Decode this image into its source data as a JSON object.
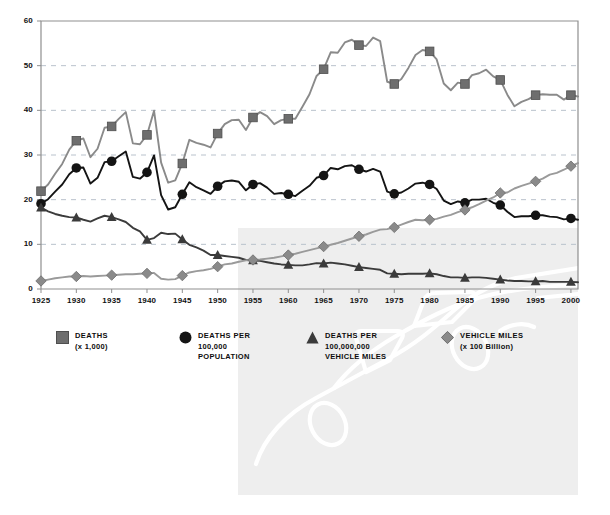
{
  "chart_data": {
    "type": "line",
    "title": "",
    "xlabel": "",
    "ylabel": "",
    "xlim": [
      1925,
      2001
    ],
    "ylim": [
      0,
      60
    ],
    "yticks": [
      0,
      10,
      20,
      30,
      40,
      50,
      60
    ],
    "xticks": [
      1925,
      1930,
      1935,
      1940,
      1945,
      1950,
      1955,
      1960,
      1965,
      1970,
      1975,
      1980,
      1985,
      1990,
      1995,
      2000
    ],
    "grid": "horizontal-dashed",
    "legend_position": "below-plot",
    "marker_years": [
      1925,
      1930,
      1935,
      1940,
      1945,
      1950,
      1955,
      1960,
      1965,
      1970,
      1975,
      1980,
      1985,
      1990,
      1995,
      2000
    ],
    "x": [
      1925,
      1926,
      1927,
      1928,
      1929,
      1930,
      1931,
      1932,
      1933,
      1934,
      1935,
      1936,
      1937,
      1938,
      1939,
      1940,
      1941,
      1942,
      1943,
      1944,
      1945,
      1946,
      1947,
      1948,
      1949,
      1950,
      1951,
      1952,
      1953,
      1954,
      1955,
      1956,
      1957,
      1958,
      1959,
      1960,
      1961,
      1962,
      1963,
      1964,
      1965,
      1966,
      1967,
      1968,
      1969,
      1970,
      1971,
      1972,
      1973,
      1974,
      1975,
      1976,
      1977,
      1978,
      1979,
      1980,
      1981,
      1982,
      1983,
      1984,
      1985,
      1986,
      1987,
      1988,
      1989,
      1990,
      1991,
      1992,
      1993,
      1994,
      1995,
      1996,
      1997,
      1998,
      1999,
      2000,
      2001
    ],
    "series": [
      {
        "name": "DEATHS (x 1,000)",
        "key": "deaths",
        "marker": "square",
        "color": "#6e6e6e",
        "line_color": "#8a8a8a",
        "values": [
          21.9,
          23.4,
          25.8,
          28.0,
          31.2,
          33.2,
          33.7,
          29.5,
          31.4,
          36.1,
          36.4,
          38.1,
          39.6,
          32.6,
          32.4,
          34.5,
          39.9,
          28.3,
          23.8,
          24.3,
          28.1,
          33.4,
          32.7,
          32.3,
          31.7,
          34.8,
          36.9,
          37.8,
          37.9,
          35.6,
          38.4,
          39.6,
          38.7,
          36.9,
          37.8,
          38.1,
          38.1,
          40.8,
          43.6,
          47.7,
          49.2,
          53.0,
          52.9,
          55.2,
          55.8,
          54.6,
          54.4,
          56.3,
          55.5,
          46.4,
          45.9,
          47.0,
          49.5,
          52.4,
          53.5,
          53.2,
          51.4,
          46.0,
          44.5,
          46.2,
          45.9,
          47.9,
          48.3,
          49.1,
          47.6,
          46.8,
          43.5,
          40.9,
          41.9,
          42.5,
          43.4,
          43.6,
          43.5,
          43.5,
          42.4,
          43.4,
          43.1
        ]
      },
      {
        "name": "DEATHS PER 100,000 POPULATION",
        "key": "deaths_per_100k_pop",
        "marker": "circle",
        "color": "#141414",
        "line_color": "#141414",
        "values": [
          19.1,
          20.1,
          21.8,
          23.4,
          25.7,
          27.1,
          27.2,
          23.6,
          24.9,
          28.4,
          28.6,
          29.7,
          30.8,
          25.1,
          24.7,
          26.1,
          29.9,
          21.0,
          17.8,
          18.3,
          21.2,
          23.9,
          22.8,
          22.1,
          21.3,
          23.0,
          24.1,
          24.3,
          24.0,
          22.1,
          23.4,
          23.7,
          22.7,
          21.3,
          21.5,
          21.2,
          20.8,
          22.0,
          23.1,
          24.9,
          25.4,
          27.1,
          26.8,
          27.5,
          27.7,
          26.8,
          26.3,
          26.9,
          26.3,
          21.8,
          21.3,
          21.6,
          22.5,
          23.6,
          23.8,
          23.4,
          22.4,
          19.8,
          19.0,
          19.6,
          19.3,
          20.0,
          20.0,
          20.2,
          19.3,
          18.8,
          17.3,
          16.1,
          16.3,
          16.3,
          16.5,
          16.5,
          16.2,
          16.1,
          15.6,
          15.8,
          15.5
        ]
      },
      {
        "name": "DEATHS PER 100,000,000 VEHICLE MILES",
        "key": "deaths_per_100m_vmt",
        "marker": "triangle",
        "color": "#3b3b3b",
        "line_color": "#3b3b3b",
        "values": [
          18.2,
          17.4,
          16.8,
          16.4,
          16.1,
          16.0,
          15.5,
          15.1,
          15.8,
          16.4,
          16.1,
          15.6,
          15.0,
          13.7,
          12.9,
          11.0,
          11.4,
          12.6,
          12.3,
          12.4,
          11.1,
          9.9,
          9.3,
          8.6,
          7.6,
          7.6,
          7.4,
          7.2,
          7.0,
          6.5,
          6.4,
          6.3,
          6.0,
          5.7,
          5.5,
          5.4,
          5.3,
          5.3,
          5.5,
          5.8,
          5.7,
          5.9,
          5.7,
          5.5,
          5.2,
          4.9,
          4.7,
          4.5,
          4.3,
          3.5,
          3.4,
          3.3,
          3.4,
          3.4,
          3.4,
          3.5,
          3.3,
          2.9,
          2.6,
          2.6,
          2.5,
          2.6,
          2.6,
          2.5,
          2.3,
          2.1,
          1.9,
          1.8,
          1.8,
          1.7,
          1.7,
          1.8,
          1.6,
          1.6,
          1.6,
          1.6,
          1.5
        ]
      },
      {
        "name": "VEHICLE MILES (x 100 Billion)",
        "key": "vehicle_miles",
        "marker": "diamond",
        "color": "#8a8a8a",
        "line_color": "#9a9a9a",
        "values": [
          1.8,
          2.1,
          2.4,
          2.6,
          2.8,
          2.8,
          2.9,
          2.8,
          2.9,
          3.0,
          3.1,
          3.2,
          3.3,
          3.3,
          3.4,
          3.5,
          3.6,
          2.3,
          2.1,
          2.2,
          3.0,
          3.7,
          4.0,
          4.2,
          4.5,
          5.0,
          5.5,
          5.7,
          6.1,
          6.4,
          6.5,
          6.6,
          6.8,
          7.0,
          7.3,
          7.6,
          7.9,
          8.3,
          8.7,
          9.1,
          9.5,
          9.9,
          10.3,
          10.8,
          11.3,
          11.8,
          12.2,
          12.8,
          13.3,
          13.4,
          13.8,
          14.4,
          15.0,
          15.5,
          15.4,
          15.5,
          15.7,
          16.2,
          16.6,
          17.2,
          17.7,
          18.3,
          19.0,
          19.8,
          20.5,
          21.5,
          21.6,
          22.5,
          23.1,
          23.6,
          24.1,
          24.7,
          25.6,
          26.0,
          26.7,
          27.5,
          28.2
        ]
      }
    ]
  },
  "legend": [
    {
      "marker": "square",
      "title": "DEATHS",
      "sub1": "(x 1,000)",
      "sub2": ""
    },
    {
      "marker": "circle",
      "title": "DEATHS PER",
      "sub1": "100,000",
      "sub2": "POPULATION"
    },
    {
      "marker": "triangle",
      "title": "DEATHS PER",
      "sub1": "100,000,000",
      "sub2": "VEHICLE MILES"
    },
    {
      "marker": "diamond",
      "title": "VEHICLE MILES",
      "sub1": "(x 100 Billion)",
      "sub2": ""
    }
  ],
  "colors": {
    "deaths": "#6e6e6e",
    "deaths_per_100k_pop": "#141414",
    "deaths_per_100m_vmt": "#3b3b3b",
    "vehicle_miles": "#8a8a8a",
    "gridline": "#b9c2cc",
    "axis": "#8f8f8f",
    "watermark_panel": "#eeeeee",
    "watermark_line": "#ffffff"
  }
}
